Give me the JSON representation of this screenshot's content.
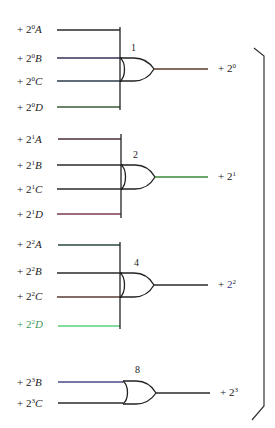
{
  "diagram": {
    "type": "OR-gate encoder logic",
    "gates": [
      {
        "id": "gate-1",
        "number_label": "1",
        "inputs": [
          {
            "prefix": "+ 2",
            "exp": "0",
            "var": "A",
            "color": "#2a2a2a"
          },
          {
            "prefix": "+ 2",
            "exp": "0",
            "var": "B",
            "color": "#3a2f55"
          },
          {
            "prefix": "+ 2",
            "exp": "0",
            "var": "C",
            "color": "#2d3b4f"
          },
          {
            "prefix": "+ 2",
            "exp": "0",
            "var": "D",
            "color": "#3a5a3a"
          }
        ],
        "output": {
          "prefix": "+ 2",
          "exp": "0",
          "color": "#5a3a2a"
        }
      },
      {
        "id": "gate-2",
        "number_label": "2",
        "inputs": [
          {
            "prefix": "+ 2",
            "exp": "1",
            "var": "A",
            "color": "#4a2f35"
          },
          {
            "prefix": "+ 2",
            "exp": "1",
            "var": "B",
            "color": "#2a2a2a"
          },
          {
            "prefix": "+ 2",
            "exp": "1",
            "var": "C",
            "color": "#2a2a2a"
          },
          {
            "prefix": "+ 2",
            "exp": "1",
            "var": "D",
            "color": "#7a3a4a"
          }
        ],
        "output": {
          "prefix": "+ 2",
          "exp": "1",
          "color": "#3a8a3a"
        }
      },
      {
        "id": "gate-4",
        "number_label": "4",
        "inputs": [
          {
            "prefix": "+ 2",
            "exp": "2",
            "var": "A",
            "color": "#2a4a3a"
          },
          {
            "prefix": "+ 2",
            "exp": "2",
            "var": "B",
            "color": "#2a2a2a"
          },
          {
            "prefix": "+ 2",
            "exp": "2",
            "var": "C",
            "color": "#5a3a35"
          },
          {
            "prefix": "+ 2",
            "exp": "2",
            "var": "D",
            "color": "#5ad07a"
          }
        ],
        "output": {
          "prefix": "+ 2",
          "exp": "2",
          "color": "#2a2a2a"
        }
      },
      {
        "id": "gate-8",
        "number_label": "8",
        "inputs": [
          {
            "prefix": "+ 2",
            "exp": "3",
            "var": "B",
            "color": "#4a4a8a"
          },
          {
            "prefix": "+ 2",
            "exp": "3",
            "var": "C",
            "color": "#2a2a2a"
          }
        ],
        "output": {
          "prefix": "+ 2",
          "exp": "3",
          "color": "#2a2a2a"
        }
      }
    ],
    "bracket": {
      "side": "right",
      "color": "#333333"
    }
  }
}
